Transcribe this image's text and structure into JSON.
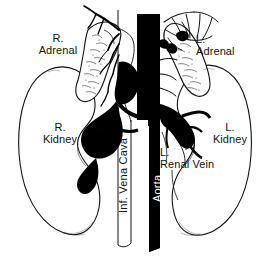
{
  "figure": {
    "colors": {
      "ink": "#111111",
      "vessel_fill_dark": "#000000",
      "organ_fill": "#ffffff",
      "background": "#ffffff",
      "label_on_dark": "#ffffff"
    }
  },
  "labels": {
    "right_adrenal": "R.\nAdrenal",
    "left_adrenal": "L.\nAdrenal",
    "right_kidney": "R.\nKidney",
    "left_kidney": "L.\nKidney",
    "left_renal_vein": "L.\nRenal Vein",
    "inferior_vena_cava": "Inf. Vena Cava",
    "aorta": "Aorta"
  },
  "structures": [
    {
      "name": "right-adrenal-gland",
      "side": "right",
      "shading": "stippled"
    },
    {
      "name": "left-adrenal-gland",
      "side": "left",
      "shading": "stippled"
    },
    {
      "name": "right-kidney",
      "side": "right",
      "shading": "outline"
    },
    {
      "name": "left-kidney",
      "side": "left",
      "shading": "outline"
    },
    {
      "name": "inferior-vena-cava",
      "shading": "solid-black"
    },
    {
      "name": "aorta",
      "shading": "solid-black"
    },
    {
      "name": "left-renal-vein",
      "shading": "solid-black"
    },
    {
      "name": "right-renal-vein",
      "shading": "solid-black"
    },
    {
      "name": "adrenal-vessels",
      "shading": "line"
    }
  ]
}
